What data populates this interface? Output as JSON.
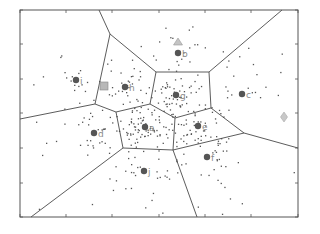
{
  "chart_data": {
    "type": "scatter",
    "title": "",
    "xlabel": "",
    "ylabel": "",
    "grid": false,
    "legend": null,
    "frame": {
      "x0": 20,
      "y0": 10,
      "x1": 298,
      "y1": 217
    },
    "x_ticks_px": [
      20,
      66,
      112,
      159,
      205,
      251,
      298
    ],
    "y_ticks_px": [
      10,
      44,
      79,
      113,
      148,
      183,
      217
    ],
    "sites": [
      {
        "label": "i",
        "x": 76,
        "y": 80
      },
      {
        "label": "h",
        "x": 125,
        "y": 87
      },
      {
        "label": "b",
        "x": 178,
        "y": 53
      },
      {
        "label": "g",
        "x": 176,
        "y": 95
      },
      {
        "label": "c",
        "x": 242,
        "y": 94
      },
      {
        "label": "d",
        "x": 94,
        "y": 133
      },
      {
        "label": "a",
        "x": 145,
        "y": 127
      },
      {
        "label": "e",
        "x": 198,
        "y": 126
      },
      {
        "label": "f",
        "x": 207,
        "y": 157
      },
      {
        "label": "j",
        "x": 144,
        "y": 171
      }
    ],
    "special_markers": [
      {
        "shape": "square",
        "x": 104,
        "y": 86,
        "color": "#b8b8b8"
      },
      {
        "shape": "triangle",
        "x": 178,
        "y": 42,
        "color": "#c4c4c4"
      },
      {
        "shape": "diamond",
        "x": 284,
        "y": 117,
        "color": "#c8c8c8"
      }
    ],
    "voronoi_edges": [
      [
        [
          99,
          10
        ],
        [
          110,
          34
        ]
      ],
      [
        [
          110,
          34
        ],
        [
          156,
          72
        ]
      ],
      [
        [
          110,
          34
        ],
        [
          95,
          104
        ]
      ],
      [
        [
          156,
          72
        ],
        [
          209,
          72
        ]
      ],
      [
        [
          209,
          72
        ],
        [
          282,
          10
        ]
      ],
      [
        [
          156,
          72
        ],
        [
          150,
          104
        ]
      ],
      [
        [
          209,
          72
        ],
        [
          211,
          108
        ]
      ],
      [
        [
          150,
          104
        ],
        [
          175,
          118
        ]
      ],
      [
        [
          175,
          118
        ],
        [
          211,
          108
        ]
      ],
      [
        [
          95,
          104
        ],
        [
          116,
          112
        ]
      ],
      [
        [
          116,
          112
        ],
        [
          150,
          104
        ]
      ],
      [
        [
          95,
          104
        ],
        [
          20,
          119
        ]
      ],
      [
        [
          116,
          112
        ],
        [
          123,
          148
        ]
      ],
      [
        [
          175,
          118
        ],
        [
          173,
          150
        ]
      ],
      [
        [
          123,
          148
        ],
        [
          173,
          150
        ]
      ],
      [
        [
          211,
          108
        ],
        [
          244,
          133
        ]
      ],
      [
        [
          244,
          133
        ],
        [
          298,
          148
        ]
      ],
      [
        [
          173,
          150
        ],
        [
          244,
          133
        ]
      ],
      [
        [
          123,
          148
        ],
        [
          31,
          217
        ]
      ],
      [
        [
          173,
          150
        ],
        [
          197,
          217
        ]
      ]
    ]
  },
  "colors": {
    "frame": "#555555",
    "edge": "#4a4a4a",
    "site": "#555555",
    "point": "#555555"
  }
}
